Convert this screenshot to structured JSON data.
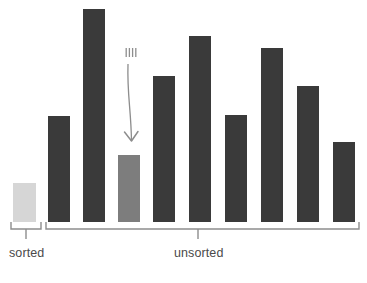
{
  "figure": {
    "name": "insertion-sort-array-diagram",
    "background": "#ffffff",
    "baseline_y": 222
  },
  "colors": {
    "bar_unsorted": "#3a3a3a",
    "bar_sorted": "#d6d6d6",
    "bar_highlighted": "#7d7d7d",
    "bracket": "#8d8d8d",
    "arrow": "#8d8d8d",
    "label_text": "#4a4a4a"
  },
  "groups": [
    {
      "id": "sorted",
      "label": "sorted",
      "label_x": 26,
      "label_y": 256,
      "bracket_left": 11,
      "bracket_right": 41,
      "bracket_tick_x": 26
    },
    {
      "id": "unsorted",
      "label": "unsorted",
      "label_x": 198,
      "label_y": 256,
      "bracket_left": 46,
      "bracket_right": 359,
      "bracket_tick_x": 198
    }
  ],
  "annotation": {
    "arrow_name": "insertion-pointer-arrow",
    "motion_ticks": 4,
    "target_bar_index": 3,
    "tick_top_y": 48,
    "tick_bottom_y": 57,
    "tick_center_x": 131,
    "arrow_start_y": 64,
    "arrow_tip_y": 141
  },
  "chart_data": {
    "type": "bar",
    "title": "",
    "subtitle": "",
    "xlabel": "",
    "ylabel": "",
    "grid": false,
    "legend": null,
    "baseline_y": 222,
    "axis_ranges": {
      "ylim": [
        0,
        215
      ]
    },
    "categories": [
      "1",
      "2",
      "3",
      "4",
      "5",
      "6",
      "7",
      "8",
      "9",
      "10"
    ],
    "values": [
      39,
      106,
      213,
      67,
      146,
      186,
      107,
      174,
      136,
      80
    ],
    "bars": [
      {
        "index": 0,
        "group": "sorted",
        "state": "sorted",
        "x": 13,
        "width": 23,
        "top": 183,
        "height": 39,
        "value": 39,
        "color": "#d6d6d6"
      },
      {
        "index": 1,
        "group": "unsorted",
        "state": "unsorted",
        "x": 48,
        "width": 22,
        "top": 116,
        "height": 106,
        "value": 106,
        "color": "#3a3a3a"
      },
      {
        "index": 2,
        "group": "unsorted",
        "state": "unsorted",
        "x": 83,
        "width": 22,
        "top": 9,
        "height": 213,
        "value": 213,
        "color": "#3a3a3a"
      },
      {
        "index": 3,
        "group": "unsorted",
        "state": "highlighted",
        "x": 118,
        "width": 22,
        "top": 155,
        "height": 67,
        "value": 67,
        "color": "#7d7d7d"
      },
      {
        "index": 4,
        "group": "unsorted",
        "state": "unsorted",
        "x": 153,
        "width": 22,
        "top": 76,
        "height": 146,
        "value": 146,
        "color": "#3a3a3a"
      },
      {
        "index": 5,
        "group": "unsorted",
        "state": "unsorted",
        "x": 189,
        "width": 22,
        "top": 36,
        "height": 186,
        "value": 186,
        "color": "#3a3a3a"
      },
      {
        "index": 6,
        "group": "unsorted",
        "state": "unsorted",
        "x": 225,
        "width": 22,
        "top": 115,
        "height": 107,
        "value": 107,
        "color": "#3a3a3a"
      },
      {
        "index": 7,
        "group": "unsorted",
        "state": "unsorted",
        "x": 261,
        "width": 22,
        "top": 48,
        "height": 174,
        "value": 174,
        "color": "#3a3a3a"
      },
      {
        "index": 8,
        "group": "unsorted",
        "state": "unsorted",
        "x": 297,
        "width": 22,
        "top": 86,
        "height": 136,
        "value": 136,
        "color": "#3a3a3a"
      },
      {
        "index": 9,
        "group": "unsorted",
        "state": "unsorted",
        "x": 333,
        "width": 22,
        "top": 142,
        "height": 80,
        "value": 80,
        "color": "#3a3a3a"
      }
    ]
  }
}
